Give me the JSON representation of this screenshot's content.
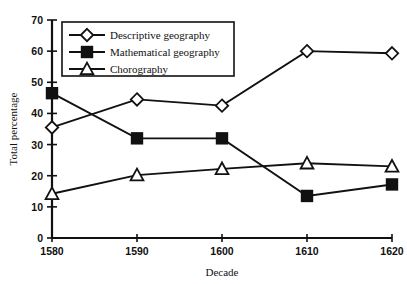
{
  "chart_data": {
    "type": "line",
    "title": "",
    "xlabel": "Decade",
    "ylabel": "Total percentage",
    "categories": [
      "1580",
      "1590",
      "1600",
      "1610",
      "1620"
    ],
    "x": [
      1580,
      1590,
      1600,
      1610,
      1620
    ],
    "xlim": [
      1580,
      1620
    ],
    "ylim": [
      0,
      70
    ],
    "yticks": [
      "0",
      "10",
      "20",
      "30",
      "40",
      "50",
      "60",
      "70"
    ],
    "ytick_values": [
      0,
      10,
      20,
      30,
      40,
      50,
      60,
      70
    ],
    "grid": false,
    "legend_position": "top-left",
    "series": [
      {
        "name": "Descriptive geography",
        "marker": "open-diamond",
        "color": "#111111",
        "values": [
          35.5,
          44.5,
          42.5,
          60.0,
          59.3
        ]
      },
      {
        "name": "Mathematical geography",
        "marker": "filled-square",
        "color": "#111111",
        "values": [
          46.5,
          32.0,
          32.0,
          13.5,
          17.2
        ]
      },
      {
        "name": "Chorography",
        "marker": "open-triangle",
        "color": "#111111",
        "values": [
          14.2,
          20.2,
          22.2,
          24.0,
          23.0
        ]
      }
    ]
  },
  "legend": {
    "items": [
      {
        "label": "Descriptive geography"
      },
      {
        "label": "Mathematical geography"
      },
      {
        "label": "Chorography"
      }
    ]
  }
}
